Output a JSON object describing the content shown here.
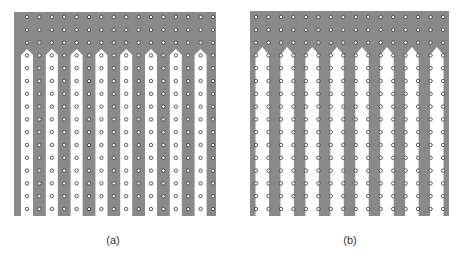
{
  "figure": {
    "background": "#ffffff",
    "ridge_color": "#8a8a8a",
    "finger_color": "#ffffff",
    "dot_fill": "#ffffff",
    "dot_stroke": "#333333",
    "dot_radius": 1.7,
    "columns": 16,
    "rows": 16,
    "header_rows": 3
  },
  "panels": [
    {
      "id": "a",
      "label": "(a)",
      "label_x": 113,
      "label_y": 235,
      "x": 14,
      "y": 12,
      "width": 202,
      "height": 204,
      "first_dot_x": 27,
      "first_dot_y": 17,
      "pitch_x": 12.4,
      "pitch_y": 12.8,
      "finger_style": "centered",
      "finger_width": 12,
      "finger_tip_y": 49,
      "finger_shoulder_y": 55,
      "description": "White fingers centered on even dot columns; grey ridges on odd columns"
    },
    {
      "id": "b",
      "label": "(b)",
      "label_x": 350,
      "label_y": 235,
      "x": 250,
      "y": 11,
      "width": 199,
      "height": 205,
      "first_dot_x": 256,
      "first_dot_y": 17,
      "pitch_x": 12.47,
      "pitch_y": 12.8,
      "finger_style": "between",
      "finger_width": 12.5,
      "finger_tip_y": 47,
      "finger_shoulder_y": 55,
      "description": "White fingers span between dot column pairs; dots on stripe edges"
    }
  ]
}
